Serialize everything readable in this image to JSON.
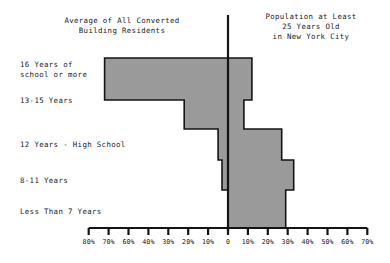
{
  "headings": {
    "left": "Average of All Converted\nBuilding Residents",
    "right": "Population at Least\n25 Years Old\nin New York City"
  },
  "axis": {
    "zero_label": "0",
    "left_ticks": [
      "80%",
      "70%",
      "60%",
      "40%",
      "30%",
      "20%",
      "10%"
    ],
    "right_ticks": [
      "10%",
      "20%",
      "30%",
      "40%",
      "50%",
      "60%",
      "70%"
    ],
    "tick_step_percent": 10,
    "left_max_percent": 80,
    "right_max_percent": 70
  },
  "style": {
    "bar_fill": "#9a9a9a",
    "bar_stroke": "#141414",
    "axis_color": "#141414",
    "text_color": "#23201f"
  },
  "chart_data": {
    "type": "bar",
    "orientation": "horizontal-pyramid",
    "title": "",
    "xlabel": "",
    "ylabel": "",
    "xlim": [
      -80,
      70
    ],
    "grid": false,
    "legend_position": "top",
    "categories": [
      "16 Years of\nschool or more",
      "13-15 Years",
      "12 Years - High School",
      "8-11 Years",
      "Less Than 7 Years"
    ],
    "series": [
      {
        "name": "Average of All Converted Building Residents",
        "side": "left",
        "values": [
          62,
          22,
          5,
          3,
          0
        ]
      },
      {
        "name": "Population at Least 25 Years Old in New York City",
        "side": "right",
        "values": [
          12,
          8,
          27,
          33,
          29
        ]
      }
    ]
  }
}
